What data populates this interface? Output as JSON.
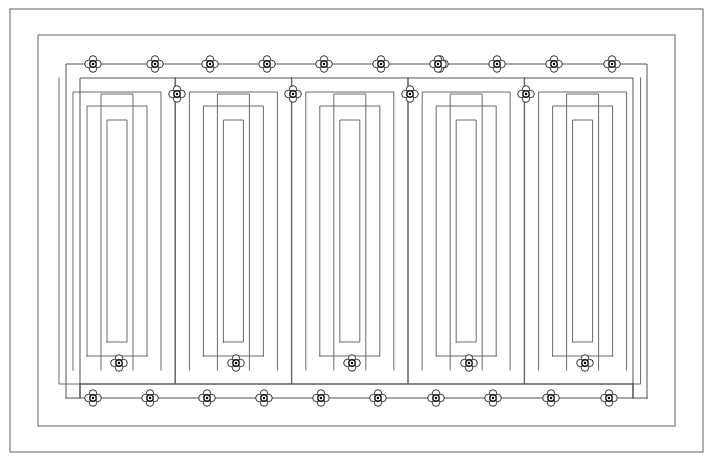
{
  "document": {
    "title": "Serpentine Coil Layout Drawing",
    "type": "technical-line-drawing",
    "background_color": "#ffffff",
    "line_color": "#4a4a4a",
    "frame_color": "#6f6f6f",
    "clamp_color": "#000000",
    "canvas": {
      "width": 713,
      "height": 461
    }
  },
  "geometry": {
    "outer_frame": {
      "x": 10,
      "y": 9,
      "width": 693,
      "height": 443
    },
    "second_frame": {
      "x": 38,
      "y": 35,
      "width": 637,
      "height": 391
    },
    "run_top_y": 64,
    "run_bottom_y": 398,
    "module_count": 5,
    "nest_depth_per_module": 3,
    "module_pitch": 116.4,
    "module_first_center_x": 117.0,
    "line_pitch": 14.0
  },
  "serpentine": {
    "outer_loop": {
      "left_x": 66,
      "right_x": 647,
      "top_y": 64,
      "bottom_y": 398,
      "inner_left_x": 80,
      "inner_right_x": 633,
      "inner_top_y": 78,
      "inner_bottom_y": 384
    }
  },
  "modules": [
    {
      "index": 1,
      "center_x": 117.0,
      "loops": 3
    },
    {
      "index": 2,
      "center_x": 233.4,
      "loops": 3
    },
    {
      "index": 3,
      "center_x": 349.8,
      "loops": 3
    },
    {
      "index": 4,
      "center_x": 466.2,
      "loops": 3
    },
    {
      "index": 5,
      "center_x": 582.6,
      "loops": 3
    }
  ],
  "clamps": {
    "symbol_name": "quatrefoil-clamp",
    "radius": 8.5,
    "rows": [
      {
        "row_name": "top-outer-row",
        "y": 64,
        "x_positions": [
          93,
          155,
          210,
          267,
          324,
          381,
          440,
          497,
          554,
          612,
          438
        ]
      },
      {
        "row_name": "top-inner-row",
        "y": 94,
        "x_positions": [
          177,
          293,
          410,
          526
        ]
      },
      {
        "row_name": "bottom-inner-row",
        "y": 363,
        "x_positions": [
          119,
          236,
          352,
          469,
          585
        ]
      },
      {
        "row_name": "bottom-outer-row",
        "y": 398,
        "x_positions": [
          93,
          150,
          207,
          264,
          321,
          378,
          436,
          493,
          551,
          609
        ]
      }
    ],
    "total_count": 30
  },
  "legend": {
    "clamp_label": "Clamp / fixing point",
    "pipe_label": "Pipe run"
  }
}
